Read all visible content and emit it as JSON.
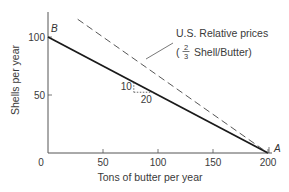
{
  "chart_data": {
    "type": "line",
    "title": "",
    "xlabel": "Tons of butter per year",
    "ylabel": "Shells per year",
    "xlim": [
      0,
      200
    ],
    "ylim": [
      0,
      125
    ],
    "x_ticks": [
      0,
      50,
      100,
      150,
      200
    ],
    "x_tick_labels": [
      "0",
      "50",
      "100",
      "150",
      "200"
    ],
    "y_ticks": [
      50,
      100
    ],
    "y_tick_labels": [
      "50",
      "100"
    ],
    "grid": false,
    "series": [
      {
        "name": "Production possibilities frontier",
        "style": "solid",
        "x": [
          0,
          200
        ],
        "y": [
          100,
          0
        ]
      },
      {
        "name": "U.S. Relative prices",
        "style": "dashed",
        "x": [
          27,
          200
        ],
        "y": [
          115.3,
          0
        ]
      }
    ],
    "points": [
      {
        "label": "B",
        "x": 0,
        "y": 100
      },
      {
        "label": "A",
        "x": 200,
        "y": 0
      }
    ],
    "annotations": {
      "relative_prices_line1": "U.S. Relative prices",
      "relative_prices_open": "(",
      "relative_prices_num": "2",
      "relative_prices_den": "3",
      "relative_prices_rest": "Shell/Butter)",
      "slope_rise": "10",
      "slope_run": "20"
    }
  }
}
